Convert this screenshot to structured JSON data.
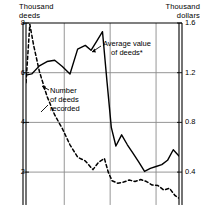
{
  "chart_data": {
    "type": "line",
    "title": "",
    "subtitle": "",
    "grid": true,
    "legend_position": "inline-annotation",
    "left_axis": {
      "title": "Thousand\ndeeds",
      "title_line1": "Thousand",
      "title_line2": "deeds",
      "ticks": [
        8,
        6,
        4,
        2
      ],
      "tick_labels": [
        "8",
        "6",
        "4",
        "2"
      ],
      "ylim": [
        0.91,
        8.0
      ],
      "ylabel": "Thousand deeds"
    },
    "right_axis": {
      "title": "Thousand\ndollars",
      "title_line1": "Thousand",
      "title_line2": "dollars",
      "ticks": [
        1.6,
        1.2,
        0.8,
        0.4
      ],
      "tick_labels": [
        "1.6",
        "1.2",
        "0.8",
        "0.4"
      ],
      "ylim": [
        0.182,
        1.6
      ],
      "ylabel": "Thousand dollars"
    },
    "xlabel": "",
    "xlim": [
      0,
      40
    ],
    "x_gridlines": [
      10,
      22,
      34
    ],
    "series": [
      {
        "name": "Average value of deeds*",
        "axis": "right",
        "style": "solid",
        "label_line1": "Average value",
        "label_line2": "of deeds*",
        "x": [
          0,
          1.5,
          3.5,
          5.5,
          7.5,
          9.5,
          11.5,
          13.5,
          15.5,
          17.0,
          18.5,
          20.0,
          21.2,
          22.3,
          23.5,
          25.0,
          26.5,
          28.0,
          29.5,
          31.0,
          32.5,
          34.0,
          35.5,
          37.0,
          38.5,
          40.0
        ],
        "values": [
          1.18,
          1.19,
          1.255,
          1.29,
          1.3,
          1.25,
          1.19,
          1.39,
          1.42,
          1.38,
          1.455,
          1.53,
          1.12,
          0.76,
          0.61,
          0.7,
          0.62,
          0.55,
          0.48,
          0.405,
          0.43,
          0.445,
          0.46,
          0.495,
          0.58,
          0.53
        ]
      },
      {
        "name": "Number of deeds recorded",
        "axis": "left",
        "style": "dashed",
        "label_line1": "Number",
        "label_line2": "of deeds",
        "label_line3": "recorded",
        "x": [
          0,
          1.0,
          2.0,
          3.5,
          5.5,
          7.5,
          9.5,
          11.5,
          13.5,
          15.5,
          17.5,
          19.0,
          20.5,
          21.5,
          22.5,
          24.0,
          25.5,
          27.0,
          28.5,
          30.0,
          31.5,
          33.0,
          34.5,
          36.0,
          37.5,
          39.0,
          40.0
        ],
        "values": [
          5.6,
          7.95,
          7.1,
          6.05,
          5.05,
          4.3,
          3.75,
          3.1,
          2.6,
          2.45,
          2.1,
          2.4,
          2.55,
          2.0,
          1.65,
          1.55,
          1.6,
          1.68,
          1.62,
          1.7,
          1.62,
          1.48,
          1.46,
          1.28,
          1.35,
          1.05,
          0.95
        ]
      }
    ],
    "footnote_marker": "*"
  }
}
